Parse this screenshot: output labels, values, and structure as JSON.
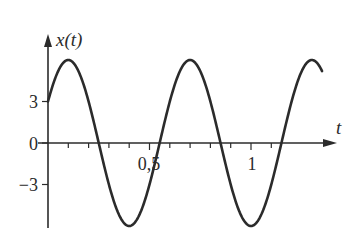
{
  "chart_data": {
    "type": "line",
    "title": "",
    "xlabel": "t",
    "ylabel": "x(t)",
    "xlim": [
      0,
      1.36
    ],
    "ylim": [
      -6,
      6
    ],
    "grid": false,
    "legend": null,
    "x_ticks": [
      0.1,
      0.2,
      0.3,
      0.4,
      0.5,
      0.6,
      0.7,
      0.8,
      0.9,
      1.0,
      1.1
    ],
    "x_tick_labels": [
      {
        "value": 0.5,
        "label": "0,5"
      },
      {
        "value": 1.0,
        "label": "1"
      }
    ],
    "y_tick_labels": [
      {
        "value": 3,
        "label": "3"
      },
      {
        "value": 0,
        "label": "0"
      },
      {
        "value": -3,
        "label": "−3"
      }
    ],
    "series": [
      {
        "name": "x(t)",
        "description": "sinusoid x(t) = 6 cos(2πt/0.6 − π/3); amplitude 6, period 0.6, x(0)=3",
        "amplitude": 6,
        "period": 0.6,
        "phase": -1.0472,
        "x": [
          0,
          0.1,
          0.25,
          0.4,
          0.55,
          0.7,
          0.85,
          1.0,
          1.15,
          1.3,
          1.35
        ],
        "values": [
          3,
          6,
          0,
          -6,
          0,
          6,
          0,
          -6,
          0,
          6,
          5.2
        ]
      }
    ],
    "color": "#2b2b2b"
  },
  "axes": {
    "y_label": "x(t)",
    "x_label": "t",
    "y_ticks": [
      "3",
      "0",
      "−3"
    ],
    "x_ticks": [
      "0,5",
      "1"
    ]
  }
}
